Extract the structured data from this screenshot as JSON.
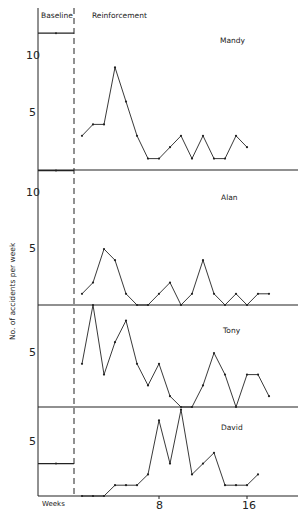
{
  "chart_data": {
    "type": "line",
    "title": "",
    "xlabel": "Weeks",
    "ylabel": "No. of accidents per week",
    "phases": [
      "Baseline",
      "Reinforcement"
    ],
    "x_ticks": [
      8,
      16
    ],
    "grid": false,
    "panels": [
      {
        "name": "Mandy",
        "y_ticks": [
          5,
          10
        ],
        "baseline": 12,
        "weeks": [
          1,
          2,
          3,
          4,
          5,
          6,
          7,
          8,
          9,
          10,
          11,
          12,
          13,
          14,
          15,
          16
        ],
        "values": [
          3,
          4,
          4,
          9,
          6,
          3,
          1,
          1,
          2,
          3,
          1,
          3,
          1,
          1,
          3,
          2
        ]
      },
      {
        "name": "Alan",
        "y_ticks": [
          5,
          10
        ],
        "baseline": 12,
        "weeks": [
          1,
          2,
          3,
          4,
          5,
          6,
          7,
          8,
          9,
          10,
          11,
          12,
          13,
          14,
          15,
          16,
          17,
          18
        ],
        "values": [
          1,
          2,
          5,
          4,
          1,
          0,
          0,
          1,
          2,
          0,
          1,
          4,
          1,
          0,
          1,
          0,
          1,
          1
        ]
      },
      {
        "name": "Tony",
        "y_ticks": [
          5
        ],
        "baseline": null,
        "weeks": [
          1,
          2,
          3,
          4,
          5,
          6,
          7,
          8,
          9,
          10,
          11,
          12,
          13,
          14,
          15,
          16,
          17,
          18
        ],
        "values": [
          4,
          9.5,
          3,
          6,
          8,
          4,
          2,
          4,
          1,
          0,
          0,
          2,
          5,
          3,
          0,
          3,
          3,
          1
        ]
      },
      {
        "name": "David",
        "y_ticks": [
          5
        ],
        "baseline": 3,
        "weeks": [
          1,
          2,
          3,
          4,
          5,
          6,
          7,
          8,
          9,
          10,
          11,
          12,
          13,
          14,
          15,
          16,
          17
        ],
        "values": [
          0,
          0,
          0,
          1,
          1,
          1,
          2,
          7,
          3,
          8,
          2,
          3,
          4,
          1,
          1,
          1,
          2
        ]
      }
    ]
  },
  "labels": {
    "baseline": "Baseline",
    "reinforcement": "Reinforcement",
    "ylabel": "No. of accidents per week",
    "weeks": "Weeks",
    "tick_8": "8",
    "tick_16": "16",
    "mandy": "Mandy",
    "alan": "Alan",
    "tony": "Tony",
    "david": "David",
    "mandy_10": "10",
    "mandy_5": "5",
    "alan_10": "10",
    "alan_5": "5",
    "tony_5": "5",
    "david_5": "5"
  }
}
